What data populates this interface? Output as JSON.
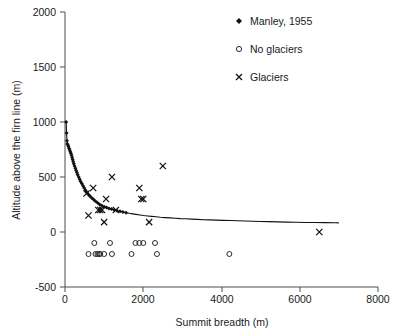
{
  "chart_data": {
    "type": "scatter",
    "title": "",
    "xlabel": "Summit breadth (m)",
    "ylabel": "Altitude above the firn line (m)",
    "xlim": [
      0,
      8000
    ],
    "ylim": [
      -500,
      2000
    ],
    "xticks": [
      0,
      2000,
      4000,
      6000,
      8000
    ],
    "yticks": [
      -500,
      0,
      500,
      1000,
      1500,
      2000
    ],
    "xtick_labels": [
      "0",
      "2000",
      "4000",
      "6000",
      "8000"
    ],
    "ytick_labels": [
      "-500",
      "0",
      "500",
      "1000",
      "1500",
      "2000"
    ],
    "grid": false,
    "legend_position": "top-right",
    "series": [
      {
        "name": "Manley, 1955",
        "marker": "filled-diamond",
        "style": "dense-markers-forming-curve",
        "color": "#111111",
        "points": [
          [
            30,
            1000
          ],
          [
            40,
            900
          ],
          [
            50,
            830
          ],
          [
            60,
            800
          ],
          [
            75,
            790
          ],
          [
            90,
            775
          ],
          [
            105,
            760
          ],
          [
            120,
            745
          ],
          [
            135,
            730
          ],
          [
            150,
            715
          ],
          [
            165,
            700
          ],
          [
            180,
            680
          ],
          [
            195,
            660
          ],
          [
            210,
            640
          ],
          [
            225,
            620
          ],
          [
            245,
            600
          ],
          [
            265,
            580
          ],
          [
            285,
            560
          ],
          [
            305,
            540
          ],
          [
            325,
            520
          ],
          [
            350,
            500
          ],
          [
            375,
            480
          ],
          [
            400,
            460
          ],
          [
            430,
            440
          ],
          [
            460,
            420
          ],
          [
            490,
            400
          ],
          [
            525,
            380
          ],
          [
            560,
            360
          ],
          [
            600,
            340
          ],
          [
            640,
            325
          ],
          [
            685,
            310
          ],
          [
            730,
            295
          ],
          [
            780,
            280
          ],
          [
            830,
            265
          ],
          [
            885,
            250
          ],
          [
            940,
            240
          ],
          [
            1000,
            230
          ],
          [
            1060,
            222
          ],
          [
            1125,
            214
          ],
          [
            1190,
            208
          ],
          [
            1260,
            200
          ],
          [
            1330,
            194
          ],
          [
            1405,
            188
          ],
          [
            1480,
            182
          ],
          [
            1560,
            176
          ],
          [
            1645,
            170
          ],
          [
            1730,
            165
          ],
          [
            1820,
            160
          ],
          [
            1915,
            155
          ],
          [
            2010,
            150
          ],
          [
            2110,
            146
          ],
          [
            2215,
            142
          ],
          [
            2325,
            138
          ],
          [
            2440,
            134
          ],
          [
            2560,
            131
          ],
          [
            2685,
            128
          ],
          [
            2815,
            125
          ],
          [
            2950,
            122
          ],
          [
            3090,
            120
          ],
          [
            3235,
            117
          ],
          [
            3385,
            115
          ],
          [
            3540,
            112
          ],
          [
            3700,
            110
          ],
          [
            3870,
            108
          ],
          [
            4045,
            106
          ],
          [
            4225,
            104
          ],
          [
            4410,
            102
          ],
          [
            4600,
            100
          ],
          [
            4800,
            98
          ],
          [
            5000,
            96
          ],
          [
            5210,
            94
          ],
          [
            5430,
            92
          ],
          [
            5660,
            90
          ],
          [
            5900,
            88
          ],
          [
            6150,
            87
          ],
          [
            6400,
            86
          ],
          [
            6650,
            85
          ],
          [
            6900,
            84
          ],
          [
            7000,
            83
          ]
        ]
      },
      {
        "name": "No glaciers",
        "marker": "open-circle",
        "color": "#2b2b2b",
        "points": [
          [
            600,
            -200
          ],
          [
            750,
            -100
          ],
          [
            780,
            -200
          ],
          [
            830,
            -200
          ],
          [
            870,
            -200
          ],
          [
            900,
            -200
          ],
          [
            1000,
            -200
          ],
          [
            1150,
            -100
          ],
          [
            1200,
            -200
          ],
          [
            1700,
            -200
          ],
          [
            1800,
            -100
          ],
          [
            1900,
            -100
          ],
          [
            2000,
            -100
          ],
          [
            2300,
            -100
          ],
          [
            2350,
            -200
          ],
          [
            4200,
            -200
          ]
        ]
      },
      {
        "name": "Glaciers",
        "marker": "cross",
        "color": "#111111",
        "points": [
          [
            550,
            350
          ],
          [
            600,
            150
          ],
          [
            720,
            400
          ],
          [
            850,
            200
          ],
          [
            900,
            200
          ],
          [
            950,
            200
          ],
          [
            1000,
            90
          ],
          [
            1050,
            300
          ],
          [
            1200,
            500
          ],
          [
            1300,
            200
          ],
          [
            1900,
            400
          ],
          [
            1950,
            300
          ],
          [
            2000,
            300
          ],
          [
            2150,
            90
          ],
          [
            2500,
            600
          ],
          [
            6500,
            0
          ]
        ]
      }
    ],
    "legend_entries": [
      {
        "label": "Manley, 1955",
        "marker": "filled-diamond"
      },
      {
        "label": "No glaciers",
        "marker": "open-circle"
      },
      {
        "label": "Glaciers",
        "marker": "cross"
      }
    ]
  }
}
